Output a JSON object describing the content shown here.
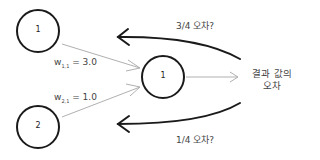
{
  "nodes": [
    {
      "id": "input-1",
      "label": "1"
    },
    {
      "id": "input-2",
      "label": "2"
    },
    {
      "id": "output",
      "label": "1"
    }
  ],
  "weights": [
    {
      "name": "w",
      "sub": "1,1",
      "text": "= 3.0"
    },
    {
      "name": "w",
      "sub": "2,1",
      "text": "= 1.0"
    }
  ],
  "output_error": {
    "line1": "결과 값의",
    "line2": "오차"
  },
  "back_labels": {
    "top": "3/4 오차?",
    "bottom": "1/4 오차?"
  },
  "colors": {
    "stroke": "#1a1a1a",
    "arrow_light": "#b0b0b0",
    "text": "#444444"
  }
}
